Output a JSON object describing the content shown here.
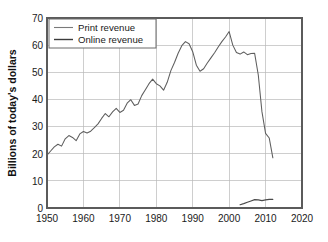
{
  "chart_data": {
    "type": "line",
    "title": "",
    "subtitle": "",
    "xlabel": "",
    "ylabel": "Billions of today's dollars",
    "xlim": [
      1950,
      2020
    ],
    "ylim": [
      0,
      70
    ],
    "grid": true,
    "legend_position": "top-left",
    "x_ticks": [
      "1950",
      "1960",
      "1970",
      "1980",
      "1990",
      "2000",
      "2010",
      "2020"
    ],
    "y_ticks": [
      "0",
      "10",
      "20",
      "30",
      "40",
      "50",
      "60",
      "70"
    ],
    "series": [
      {
        "name": "Print revenue",
        "color": "#5e5e5e",
        "x": [
          1950,
          1951,
          1952,
          1953,
          1954,
          1955,
          1956,
          1957,
          1958,
          1959,
          1960,
          1961,
          1962,
          1963,
          1964,
          1965,
          1966,
          1967,
          1968,
          1969,
          1970,
          1971,
          1972,
          1973,
          1974,
          1975,
          1976,
          1977,
          1978,
          1979,
          1980,
          1981,
          1982,
          1983,
          1984,
          1985,
          1986,
          1987,
          1988,
          1989,
          1990,
          1991,
          1992,
          1993,
          1994,
          1995,
          1996,
          1997,
          1998,
          1999,
          2000,
          2001,
          2002,
          2003,
          2004,
          2005,
          2006,
          2007,
          2008,
          2009,
          2010,
          2011,
          2012
        ],
        "values": [
          19.5,
          21.0,
          22.5,
          23.5,
          22.8,
          25.5,
          26.7,
          26.0,
          24.8,
          27.3,
          28.2,
          27.6,
          28.3,
          29.6,
          31.0,
          33.0,
          34.8,
          33.6,
          35.4,
          36.7,
          35.2,
          36.0,
          38.6,
          39.9,
          37.8,
          38.3,
          41.4,
          43.6,
          45.8,
          47.5,
          45.8,
          45.0,
          43.4,
          46.3,
          50.6,
          53.6,
          57.0,
          59.8,
          61.3,
          60.5,
          57.6,
          52.6,
          50.4,
          51.3,
          53.4,
          55.3,
          57.2,
          59.3,
          61.3,
          63.0,
          65.0,
          60.0,
          57.3,
          56.7,
          57.5,
          56.5,
          56.9,
          57.0,
          49.0,
          35.5,
          27.5,
          25.8,
          18.5
        ]
      },
      {
        "name": "Online revenue",
        "color": "#4a4a4a",
        "x": [
          2003,
          2004,
          2005,
          2006,
          2007,
          2008,
          2009,
          2010,
          2011,
          2012
        ],
        "values": [
          1.2,
          1.6,
          2.1,
          2.6,
          3.1,
          3.0,
          2.7,
          3.0,
          3.2,
          3.2
        ]
      }
    ]
  },
  "legend": {
    "entries": [
      {
        "label": "Print revenue"
      },
      {
        "label": "Online revenue"
      }
    ]
  },
  "axes": {
    "y_title": "Billions of today's dollars"
  }
}
